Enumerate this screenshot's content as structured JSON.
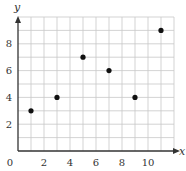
{
  "chart_data": {
    "type": "scatter",
    "title": "",
    "xlabel": "x",
    "ylabel": "y",
    "xlim": [
      0,
      12
    ],
    "ylim": [
      0,
      10
    ],
    "grid": true,
    "grid_step": 1,
    "x_ticks": [
      2,
      4,
      6,
      8,
      10
    ],
    "y_ticks": [
      2,
      4,
      6,
      8
    ],
    "origin_label": "0",
    "points": [
      {
        "x": 1,
        "y": 3
      },
      {
        "x": 3,
        "y": 4
      },
      {
        "x": 5,
        "y": 7
      },
      {
        "x": 7,
        "y": 6
      },
      {
        "x": 9,
        "y": 4
      },
      {
        "x": 11,
        "y": 9
      }
    ],
    "colors": {
      "grid": "#c8c8c8",
      "axis": "#333333",
      "point": "#111111"
    }
  }
}
